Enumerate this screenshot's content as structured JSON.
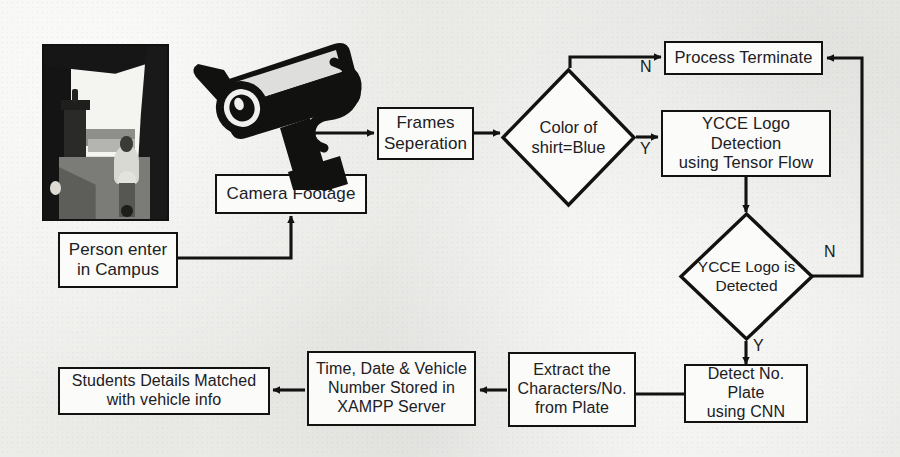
{
  "diagram": {
    "type": "flowchart",
    "background_color": "#eeeeec",
    "stroke_color": "#121211",
    "node_fill_color": "#fbfbfa"
  },
  "images": {
    "campus_photo": {
      "name": "campus-entrance-photo",
      "description": "Grayscale photograph of a person riding a motorbike through a campus gate archway"
    },
    "cctv_icon": {
      "name": "cctv-camera-icon",
      "description": "Black silhouette of a CCTV surveillance camera with cable"
    }
  },
  "nodes": [
    {
      "id": "person_enter",
      "label": "Person enter\nin Campus",
      "shape": "process"
    },
    {
      "id": "camera_footage",
      "label": "Camera Footage",
      "shape": "process"
    },
    {
      "id": "frames_sep",
      "label": "Frames\nSeperation",
      "shape": "process"
    },
    {
      "id": "color_shirt",
      "label": "Color of\nshirt=Blue",
      "shape": "decision"
    },
    {
      "id": "process_term",
      "label": "Process Terminate",
      "shape": "process"
    },
    {
      "id": "ycce_detect",
      "label": "YCCE Logo Detection\nusing Tensor Flow",
      "shape": "process"
    },
    {
      "id": "ycce_is_det",
      "label": "YCCE Logo is\nDetected",
      "shape": "decision"
    },
    {
      "id": "detect_plate",
      "label": "Detect No. Plate\nusing CNN",
      "shape": "process"
    },
    {
      "id": "extract_chars",
      "label": "Extract the\nCharacters/No.\nfrom Plate",
      "shape": "process"
    },
    {
      "id": "store_xampp",
      "label": "Time, Date & Vehicle\nNumber Stored in\nXAMPP Server",
      "shape": "process"
    },
    {
      "id": "match_students",
      "label": "Students Details Matched\nwith vehicle info",
      "shape": "process"
    }
  ],
  "branch_labels": [
    {
      "id": "color_no",
      "label": "N",
      "from": "color_shirt",
      "to": "process_term"
    },
    {
      "id": "color_yes",
      "label": "Y",
      "from": "color_shirt",
      "to": "ycce_detect"
    },
    {
      "id": "ycce_no",
      "label": "N",
      "from": "ycce_is_det",
      "to": "process_term"
    },
    {
      "id": "ycce_yes",
      "label": "Y",
      "from": "ycce_is_det",
      "to": "detect_plate"
    }
  ],
  "edges": [
    {
      "from": "person_enter",
      "to": "camera_footage"
    },
    {
      "from": "camera_footage",
      "to": "frames_sep"
    },
    {
      "from": "frames_sep",
      "to": "color_shirt"
    },
    {
      "from": "color_shirt",
      "to": "process_term"
    },
    {
      "from": "color_shirt",
      "to": "ycce_detect"
    },
    {
      "from": "ycce_detect",
      "to": "ycce_is_det"
    },
    {
      "from": "ycce_is_det",
      "to": "process_term"
    },
    {
      "from": "ycce_is_det",
      "to": "detect_plate"
    },
    {
      "from": "detect_plate",
      "to": "extract_chars"
    },
    {
      "from": "extract_chars",
      "to": "store_xampp"
    },
    {
      "from": "store_xampp",
      "to": "match_students"
    }
  ]
}
